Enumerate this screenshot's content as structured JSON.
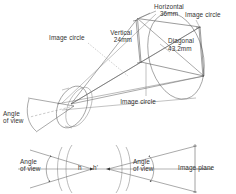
{
  "figure": {
    "type": "optical-diagram",
    "title_visible": false,
    "background_color": "#ffffff",
    "line_color": "#3a3a3a",
    "text_color": "#333333"
  },
  "upper_diagram": {
    "name": "perspective-view-cone-and-image-circle",
    "labels": {
      "horizontal": "Horizontal",
      "horizontal_value": "36mm",
      "vertical": "Vertical",
      "vertical_value": "24mm",
      "diagonal": "Diagonal",
      "diagonal_value": "43.2mm",
      "image_circle_right": "Image circle",
      "image_circle_left": "Image circle",
      "image_circle_bottom": "Image circle",
      "angle_of_view": "Angle\nof view"
    }
  },
  "lower_diagram": {
    "name": "cross-section-angle-of-view",
    "labels": {
      "angle_of_view_left": "Angle\nof view",
      "angle_of_view_right": "Angle\nof view",
      "h": "h",
      "h_prime": "h'",
      "image_plane": "Image plane"
    }
  }
}
